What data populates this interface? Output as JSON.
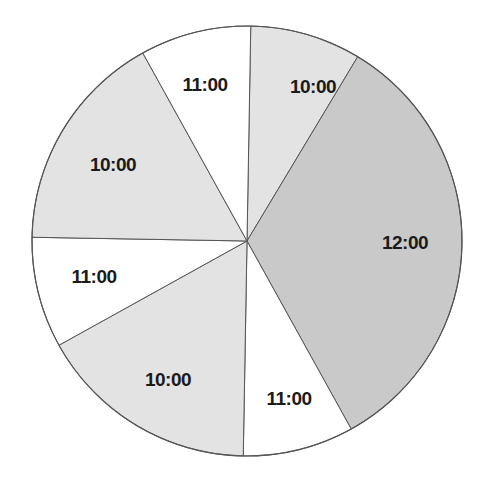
{
  "chart_data": {
    "type": "pie",
    "title": "",
    "start_angle_deg": -89,
    "direction": "clockwise",
    "center": [
      247,
      241
    ],
    "radius": 215,
    "slices": [
      {
        "label": "10:00",
        "value": 1,
        "angle_deg": 30,
        "color": "#e3e3e3",
        "label_pos": [
          313,
          88
        ]
      },
      {
        "label": "12:00",
        "value": 4,
        "angle_deg": 120,
        "color": "#c9c9c9",
        "label_pos": [
          405,
          244
        ]
      },
      {
        "label": "11:00",
        "value": 1,
        "angle_deg": 30,
        "color": "#ffffff",
        "label_pos": [
          289,
          400
        ]
      },
      {
        "label": "10:00",
        "value": 2,
        "angle_deg": 60,
        "color": "#e3e3e3",
        "label_pos": [
          168,
          381
        ]
      },
      {
        "label": "11:00",
        "value": 1,
        "angle_deg": 30,
        "color": "#ffffff",
        "label_pos": [
          94,
          278
        ]
      },
      {
        "label": "10:00",
        "value": 2,
        "angle_deg": 60,
        "color": "#e3e3e3",
        "label_pos": [
          113,
          166
        ]
      },
      {
        "label": "11:00",
        "value": 1,
        "angle_deg": 30,
        "color": "#ffffff",
        "label_pos": [
          205,
          86
        ]
      }
    ],
    "categories": [
      "10:00",
      "12:00",
      "11:00",
      "10:00",
      "11:00",
      "10:00",
      "11:00"
    ],
    "values": [
      1,
      4,
      1,
      2,
      1,
      2,
      1
    ],
    "legend": "none",
    "stroke_color": "#555555"
  }
}
